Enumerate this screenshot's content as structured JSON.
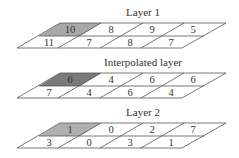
{
  "layers": [
    {
      "title": "Layer 1",
      "top_row": [
        "10",
        "8",
        "9",
        "5"
      ],
      "bottom_row": [
        "11",
        "7",
        "8",
        "7"
      ],
      "highlight": "#a9a9a9"
    },
    {
      "title": "Interpolated layer",
      "top_row": [
        "6",
        "4",
        "6",
        "6"
      ],
      "bottom_row": [
        "7",
        "4",
        "6",
        "4"
      ],
      "highlight": "#7a7a7a"
    },
    {
      "title": "Layer 2",
      "top_row": [
        "1",
        "0",
        "2",
        "7"
      ],
      "bottom_row": [
        "3",
        "0",
        "3",
        "1"
      ],
      "highlight": "#b0b0b0"
    }
  ]
}
